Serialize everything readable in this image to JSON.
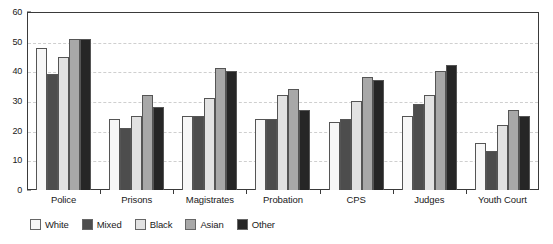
{
  "chart_data": {
    "type": "bar",
    "title": "",
    "xlabel": "",
    "ylabel": "",
    "ylim": [
      0,
      60
    ],
    "ytick_step": 10,
    "yticks": [
      0,
      10,
      20,
      30,
      40,
      50,
      60
    ],
    "grid": true,
    "grid_style": "dashed horizontal",
    "legend_position": "bottom-left",
    "categories": [
      "Police",
      "Prisons",
      "Magistrates",
      "Probation",
      "CPS",
      "Judges",
      "Youth Court"
    ],
    "series": [
      {
        "name": "White",
        "color": "#f7f7f7",
        "values": [
          48,
          24,
          25,
          24,
          23,
          25,
          16
        ]
      },
      {
        "name": "Mixed",
        "color": "#4d4d4d",
        "values": [
          39,
          21,
          25,
          24,
          24,
          29,
          13
        ]
      },
      {
        "name": "Black",
        "color": "#e2e2e2",
        "values": [
          45,
          25,
          31,
          32,
          30,
          32,
          22
        ]
      },
      {
        "name": "Asian",
        "color": "#a8a8a8",
        "values": [
          51,
          32,
          41,
          34,
          38,
          40,
          27
        ]
      },
      {
        "name": "Other",
        "color": "#262626",
        "values": [
          51,
          28,
          40,
          27,
          37,
          42,
          25
        ]
      }
    ]
  },
  "colors": {
    "frame": "#3a3a3a",
    "gridline": "#cfcfcf",
    "text": "#1a1a1a",
    "background": "#ffffff"
  }
}
